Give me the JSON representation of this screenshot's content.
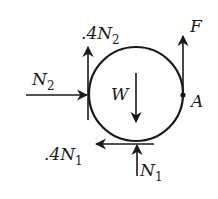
{
  "diagram": {
    "type": "free-body-diagram",
    "body": {
      "shape": "circle",
      "center": [
        136,
        94
      ],
      "radius": 47,
      "stroke": "#1a1a1a"
    },
    "point": {
      "label": "A",
      "x": 183,
      "y": 95
    },
    "forces": [
      {
        "id": "N2",
        "label": "N",
        "subscript": "2",
        "prefix": "",
        "direction": "right",
        "applied_at": "left side"
      },
      {
        "id": "friction2",
        "label": "N",
        "subscript": "2",
        "prefix": ".4",
        "direction": "up",
        "applied_at": "left side"
      },
      {
        "id": "W",
        "label": "W",
        "subscript": "",
        "prefix": "",
        "direction": "down",
        "applied_at": "center"
      },
      {
        "id": "F",
        "label": "F",
        "subscript": "",
        "prefix": "",
        "direction": "up",
        "applied_at": "A"
      },
      {
        "id": "friction1",
        "label": "N",
        "subscript": "1",
        "prefix": ".4",
        "direction": "left",
        "applied_at": "bottom"
      },
      {
        "id": "N1",
        "label": "N",
        "subscript": "1",
        "prefix": "",
        "direction": "up",
        "applied_at": "bottom"
      }
    ]
  },
  "labels": {
    "n2_main": "N",
    "n2_sub": "2",
    "f2_prefix": ".4N",
    "f2_sub": "2",
    "w": "W",
    "f": "F",
    "a": "A",
    "f1_prefix": ".4N",
    "f1_sub": "1",
    "n1_main": "N",
    "n1_sub": "1"
  }
}
